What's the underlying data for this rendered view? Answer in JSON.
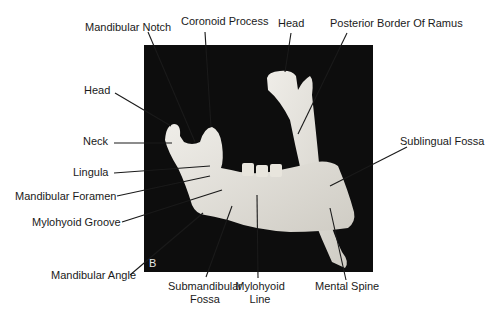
{
  "figure": {
    "panel_letter": "B",
    "labels": {
      "mandibular_notch": "Mandibular Notch",
      "coronoid_process": "Coronoid Process",
      "head_right": "Head",
      "posterior_border_of_ramus": "Posterior Border Of Ramus",
      "head_left": "Head",
      "neck": "Neck",
      "sublingual_fossa": "Sublingual Fossa",
      "lingula": "Lingula",
      "mandibular_foramen": "Mandibular Foramen",
      "mylohyoid_groove": "Mylohyoid Groove",
      "mandibular_angle": "Mandibular Angle",
      "submandibular_fossa_line1": "Submandibular",
      "submandibular_fossa_line2": "Fossa",
      "mylohyoid_line_line1": "Mylohyoid",
      "mylohyoid_line_line2": "Line",
      "mental_spine": "Mental Spine"
    },
    "colors": {
      "background": "#ffffff",
      "photo_background": "#0d0d0d",
      "bone": "#e4e2dc",
      "leader_line": "#1a1a1a"
    }
  }
}
